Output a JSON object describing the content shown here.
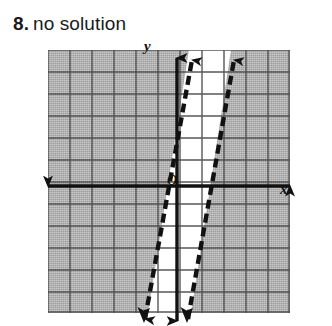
{
  "problem": {
    "number": "8.",
    "answer": "no solution"
  },
  "graph": {
    "axis_labels": {
      "x": "x",
      "y": "y",
      "origin": "O"
    },
    "colors": {
      "shading": "#b0b0b0",
      "unshaded": "#ffffff",
      "grid_line": "#4a4a4a",
      "axis": "#111111",
      "boundary_line": "#111111"
    },
    "grid": {
      "columns": 11,
      "rows": 12,
      "cell_size_px": 22,
      "x_axis_row": 6,
      "y_axis_column": 6
    },
    "boundary_lines": [
      {
        "name": "left-boundary",
        "style": "dashed",
        "arrow_top": true,
        "arrow_bottom": true,
        "top_x_px": 144,
        "bottom_x_px": 97
      },
      {
        "name": "right-boundary",
        "style": "dashed",
        "arrow_top": true,
        "arrow_bottom": true,
        "top_x_px": 186,
        "bottom_x_px": 140
      }
    ],
    "shaded_description": "region outside the strip between both dashed lines",
    "unshaded_description": "narrow strip between the two parallel dashed lines"
  }
}
